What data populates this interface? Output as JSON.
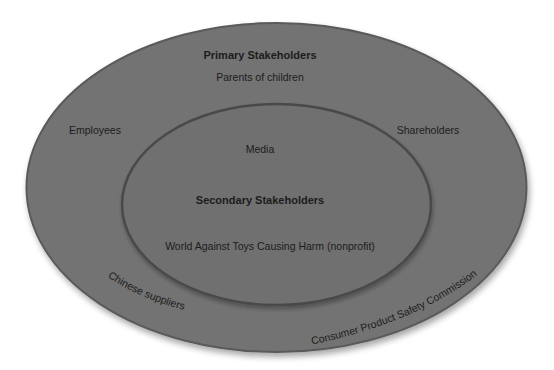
{
  "diagram": {
    "type": "nested-ellipse stakeholder map",
    "colors": {
      "background": "#ffffff",
      "outer_fill": "#737373",
      "outer_stroke": "#5a5a5a",
      "inner_fill": "#6f6f6f",
      "inner_stroke": "#4a4a4a",
      "text": "#1c1c1c"
    },
    "outer": {
      "title": "Primary Stakeholders",
      "items": {
        "top": "Parents of children",
        "left": "Employees",
        "right": "Shareholders",
        "bottom_left": "Chinese suppliers",
        "bottom_right": "Consumer Product Safety Commission"
      }
    },
    "inner": {
      "title": "Secondary Stakeholders",
      "items": {
        "top": "Media",
        "bottom": "World Against Toys Causing Harm (nonprofit)"
      }
    }
  }
}
